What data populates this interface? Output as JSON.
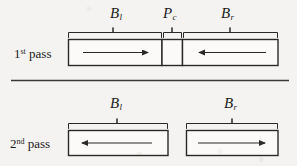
{
  "figure": {
    "title_present": false,
    "background_color": "#f4f3f1",
    "ink_color": "#1d1c1b",
    "rows": [
      {
        "id": "first-pass",
        "row_label": "1",
        "row_label_suffix": "st",
        "row_label_word": "pass",
        "separator_below": true,
        "segments": [
          {
            "name": "b-left",
            "brace_label_base": "B",
            "brace_label_sub": "l",
            "arrow_direction": "right",
            "x": 68,
            "width": 94
          },
          {
            "name": "p-center",
            "brace_label_base": "P",
            "brace_label_sub": "c",
            "arrow_direction": "none",
            "x": 163,
            "width": 19
          },
          {
            "name": "b-right",
            "brace_label_base": "B",
            "brace_label_sub": "r",
            "arrow_direction": "left",
            "x": 183,
            "width": 95
          }
        ]
      },
      {
        "id": "second-pass",
        "row_label": "2",
        "row_label_suffix": "nd",
        "row_label_word": "pass",
        "separator_below": false,
        "segments": [
          {
            "name": "b-left",
            "brace_label_base": "B",
            "brace_label_sub": "l",
            "arrow_direction": "left",
            "x": 68,
            "width": 100
          },
          {
            "name": "b-right",
            "brace_label_base": "B",
            "brace_label_sub": "r",
            "arrow_direction": "right",
            "x": 186,
            "width": 92
          }
        ]
      }
    ],
    "labels": {
      "row1_pass_num": "1",
      "row1_pass_sup": "st",
      "row1_pass_word": "pass",
      "row2_pass_num": "2",
      "row2_pass_sup": "nd",
      "row2_pass_word": "pass",
      "r1_seg1_base": "B",
      "r1_seg1_sub": "l",
      "r1_seg2_base": "P",
      "r1_seg2_sub": "c",
      "r1_seg3_base": "B",
      "r1_seg3_sub": "r",
      "r2_seg1_base": "B",
      "r2_seg1_sub": "l",
      "r2_seg2_base": "B",
      "r2_seg2_sub": "r"
    }
  }
}
